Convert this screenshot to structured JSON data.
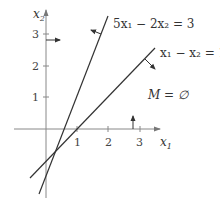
{
  "diagram": {
    "type": "linear-inequalities-plot",
    "axes": {
      "x_label": "x",
      "x_label_sub": "1",
      "y_label": "x",
      "y_label_sub": "2",
      "x_ticks": [
        "1",
        "2",
        "3"
      ],
      "y_ticks": [
        "1",
        "2",
        "3"
      ]
    },
    "lines": [
      {
        "name": "steep-line",
        "label": "5x₁ − 2x₂ = 3",
        "equation": "5x1 - 2x2 = 3",
        "normal_direction": "up-left"
      },
      {
        "name": "diagonal-line",
        "label": "x₁ − x₂ = 1",
        "equation": "x1 - x2 = 1",
        "normal_direction": "down-right"
      }
    ],
    "constraint_arrows": [
      {
        "name": "x1-arrow",
        "description": "vertical arrow at x1 near 2.8 pointing up"
      },
      {
        "name": "x2-arrow",
        "description": "horizontal arrow at x2 near 2.8 pointing right"
      }
    ],
    "annotation": "M = ∅",
    "colors": {
      "axis": "#888888",
      "line": "#333333",
      "text": "#333333"
    }
  }
}
